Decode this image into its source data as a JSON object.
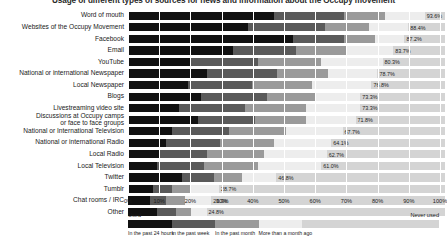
{
  "title": "Usage of different types of sources for news and information about the Occupy movement",
  "axis": {
    "ticks": [
      "0%",
      "10%",
      "20%",
      "30%",
      "40%",
      "50%",
      "60%",
      "70%",
      "80%",
      "90%",
      "100%"
    ],
    "min": 0,
    "max": 100
  },
  "legend": {
    "used_label": "Used",
    "never_used_label": "Never used",
    "segments": [
      {
        "name": "In the past 24 hours",
        "color": "#111111"
      },
      {
        "name": "In the past week",
        "color": "#5a5a5a"
      },
      {
        "name": "In the past month",
        "color": "#9a9a9a"
      },
      {
        "name": "More than a month ago",
        "color": "#ededed"
      },
      {
        "name": "Never used",
        "color": "#d4d4d4"
      }
    ]
  },
  "chart_data": {
    "type": "bar",
    "orientation": "horizontal",
    "stacked": true,
    "title": "Usage of different types of sources for news and information about the Occupy movement",
    "xlabel": "",
    "ylabel": "",
    "xlim": [
      0,
      100
    ],
    "grid": true,
    "legend_position": "bottom",
    "series": [
      {
        "name": "In the past 24 hours",
        "color": "#111111"
      },
      {
        "name": "In the past week",
        "color": "#5a5a5a"
      },
      {
        "name": "In the past month",
        "color": "#9a9a9a"
      },
      {
        "name": "More than a month ago",
        "color": "#ededed"
      },
      {
        "name": "Never used",
        "color": "#d4d4d4"
      }
    ],
    "categories": [
      "Word of mouth",
      "Websites of the Occupy Movement",
      "Facebook",
      "Email",
      "YouTube",
      "National or international Newspaper",
      "Local Newspaper",
      "Blogs",
      "Livestreaming video site",
      "Discussions at Occupy camps\nor face to face groups",
      "National or International Television",
      "National or international Radio",
      "Local Radio",
      "Local Television",
      "Twitter",
      "Tumblr",
      "Chat rooms / IRC",
      "Other"
    ],
    "total_used": [
      93.6,
      88.4,
      87.2,
      83.7,
      80.3,
      78.7,
      76.8,
      73.3,
      73.3,
      71.8,
      67.7,
      64.1,
      62.7,
      61.0,
      46.8,
      28.7,
      26.3,
      24.8
    ],
    "value_labels": [
      "93.6%",
      "88.4%",
      "87.2%",
      "83.7%",
      "80.3%",
      "78.7%",
      "76.8%",
      "73.3%",
      "73.3%",
      "71.8%",
      "67.7%",
      "64.1%",
      "62.7%",
      "61.0%",
      "46.8%",
      "28.7%",
      "26.3%",
      "24.8%"
    ],
    "rows": [
      {
        "label": "Word of mouth",
        "value_label": "93.6%",
        "segments": [
          46.0,
          22.0,
          13.0,
          12.6,
          6.4
        ]
      },
      {
        "label": "Websites of the Occupy Movement",
        "value_label": "88.4%",
        "segments": [
          38.0,
          24.0,
          14.0,
          12.4,
          11.6
        ]
      },
      {
        "label": "Facebook",
        "value_label": "87.2%",
        "segments": [
          52.0,
          16.0,
          10.0,
          9.2,
          12.8
        ]
      },
      {
        "label": "Email",
        "value_label": "83.7%",
        "segments": [
          33.0,
          20.0,
          16.0,
          14.7,
          16.3
        ]
      },
      {
        "label": "YouTube",
        "value_label": "80.3%",
        "segments": [
          20.0,
          21.0,
          20.0,
          19.3,
          19.7
        ]
      },
      {
        "label": "National or international Newspaper",
        "value_label": "78.7%",
        "segments": [
          25.0,
          22.0,
          16.0,
          15.7,
          21.3
        ]
      },
      {
        "label": "Local Newspaper",
        "value_label": "76.8%",
        "segments": [
          19.0,
          20.0,
          19.0,
          18.8,
          23.2
        ]
      },
      {
        "label": "Blogs",
        "value_label": "73.3%",
        "segments": [
          23.0,
          21.0,
          15.0,
          14.3,
          26.7
        ]
      },
      {
        "label": "Livestreaming video site",
        "value_label": "73.3%",
        "segments": [
          16.0,
          21.0,
          19.0,
          17.3,
          26.7
        ]
      },
      {
        "label": "Discussions at Occupy camps\nor face to face groups",
        "value_label": "71.8%",
        "segments": [
          22.0,
          18.0,
          16.0,
          15.8,
          28.2
        ]
      },
      {
        "label": "National or International Television",
        "value_label": "67.7%",
        "segments": [
          14.0,
          18.0,
          18.0,
          17.7,
          32.3
        ]
      },
      {
        "label": "National or international Radio",
        "value_label": "64.1%",
        "segments": [
          12.0,
          17.0,
          17.0,
          18.1,
          35.9
        ]
      },
      {
        "label": "Local Radio",
        "value_label": "62.7%",
        "segments": [
          10.0,
          15.0,
          18.0,
          19.7,
          37.3
        ]
      },
      {
        "label": "Local Television",
        "value_label": "61.0%",
        "segments": [
          9.0,
          15.0,
          17.0,
          20.0,
          39.0
        ]
      },
      {
        "label": "Twitter",
        "value_label": "46.8%",
        "segments": [
          17.0,
          10.0,
          9.0,
          10.8,
          53.2
        ]
      },
      {
        "label": "Tumblr",
        "value_label": "28.7%",
        "segments": [
          8.0,
          6.0,
          6.0,
          8.7,
          71.3
        ]
      },
      {
        "label": "Chat rooms / IRC",
        "value_label": "26.3%",
        "segments": [
          7.0,
          5.0,
          6.0,
          8.3,
          73.7
        ]
      },
      {
        "label": "Other",
        "value_label": "24.8%",
        "segments": [
          9.0,
          6.0,
          5.0,
          4.8,
          75.2
        ]
      }
    ]
  }
}
